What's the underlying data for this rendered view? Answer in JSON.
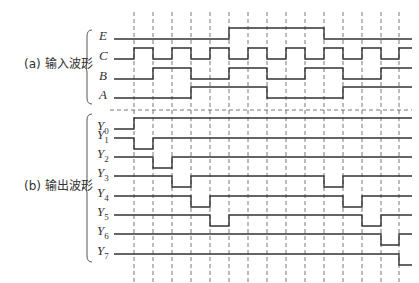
{
  "colors": {
    "wave": "#333333",
    "dashed": "#555555",
    "text": "#333333",
    "background": "#ffffff"
  },
  "groups": [
    {
      "id": "input",
      "label": "(a) 输入波形",
      "label_x": 24,
      "label_y": 62,
      "brace_top": 30,
      "brace_bottom": 104
    },
    {
      "id": "output",
      "label": "(b) 输出波形",
      "label_x": 24,
      "label_y": 184,
      "brace_top": 114,
      "brace_bottom": 262
    }
  ],
  "timing": {
    "x_start": 114,
    "x_end": 412,
    "tick_x": [
      134,
      153,
      172,
      191,
      210,
      229,
      248,
      267,
      286,
      305,
      324,
      343,
      362,
      381,
      399
    ],
    "tick_top": 12,
    "tick_bottom": 283,
    "separator_y": 110,
    "separator_x_start": 110,
    "separator_x_end": 412,
    "pulse_height": 11
  },
  "signals": [
    {
      "name": "E",
      "sub": "",
      "group": "input",
      "y": 39,
      "initial": 0,
      "transitions": [
        5,
        10
      ]
    },
    {
      "name": "C",
      "sub": "",
      "group": "input",
      "y": 59,
      "initial": 0,
      "transitions": [
        0,
        1,
        2,
        3,
        4,
        5,
        6,
        7,
        8,
        9,
        10,
        11,
        12,
        13,
        14
      ]
    },
    {
      "name": "B",
      "sub": "",
      "group": "input",
      "y": 79,
      "initial": 0,
      "transitions": [
        1,
        3,
        5,
        7,
        9,
        11,
        13
      ]
    },
    {
      "name": "A",
      "sub": "",
      "group": "input",
      "y": 98,
      "initial": 0,
      "transitions": [
        3,
        7,
        11
      ]
    },
    {
      "name": "Y",
      "sub": "0",
      "group": "output",
      "y": 129,
      "initial": 0,
      "transitions": [
        0
      ]
    },
    {
      "name": "Y",
      "sub": "1",
      "group": "output",
      "y": 149,
      "initial": 1,
      "transitions": [
        0,
        1
      ]
    },
    {
      "name": "Y",
      "sub": "2",
      "group": "output",
      "y": 168,
      "initial": 1,
      "transitions": [
        1,
        2
      ]
    },
    {
      "name": "Y",
      "sub": "3",
      "group": "output",
      "y": 187,
      "initial": 1,
      "transitions": [
        2,
        3,
        10,
        11
      ]
    },
    {
      "name": "Y",
      "sub": "4",
      "group": "output",
      "y": 207,
      "initial": 1,
      "transitions": [
        3,
        4,
        11,
        12
      ]
    },
    {
      "name": "Y",
      "sub": "5",
      "group": "output",
      "y": 226,
      "initial": 1,
      "transitions": [
        4,
        5,
        12,
        13
      ]
    },
    {
      "name": "Y",
      "sub": "6",
      "group": "output",
      "y": 245,
      "initial": 1,
      "transitions": [
        13,
        14
      ]
    },
    {
      "name": "Y",
      "sub": "7",
      "group": "output",
      "y": 265,
      "initial": 1,
      "transitions": [
        14
      ]
    }
  ]
}
